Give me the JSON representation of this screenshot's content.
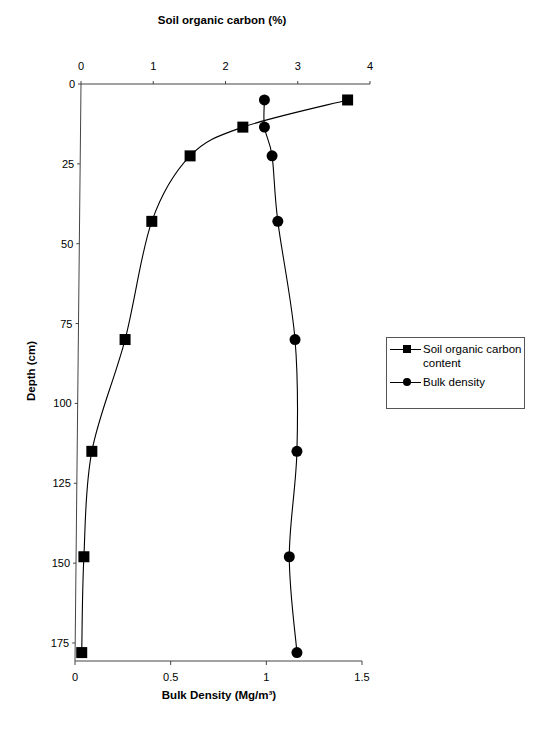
{
  "chart_data": {
    "type": "line",
    "title": "",
    "orientation": "depth-profile (y axis inverted, depth increases downward)",
    "top_axis": {
      "label": "Soil organic carbon (%)",
      "range": [
        0,
        4
      ],
      "ticks": [
        "0",
        "1",
        "2",
        "3",
        "4"
      ]
    },
    "bottom_axis": {
      "label": "Bulk Density (Mg/m³)",
      "range": [
        0,
        1.5
      ],
      "ticks": [
        "0",
        "0.5",
        "1",
        "1.5"
      ]
    },
    "left_axis": {
      "label": "Depth (cm)",
      "range": [
        0,
        180
      ],
      "ticks": [
        "0",
        "25",
        "50",
        "75",
        "100",
        "125",
        "150",
        "175"
      ]
    },
    "grid": false,
    "legend_position": "right",
    "series": [
      {
        "name": "Soil organic carbon content",
        "axis": "top",
        "marker": "square",
        "depth": [
          5,
          13.5,
          22.5,
          43,
          80,
          115,
          148,
          178
        ],
        "values": [
          3.69,
          2.24,
          1.51,
          0.98,
          0.61,
          0.15,
          0.04,
          0.01
        ]
      },
      {
        "name": "Bulk density",
        "axis": "bottom",
        "marker": "circle",
        "depth": [
          5,
          13.5,
          22.5,
          43,
          80,
          115,
          148,
          178
        ],
        "values": [
          0.99,
          0.99,
          1.03,
          1.06,
          1.15,
          1.16,
          1.12,
          1.16
        ]
      }
    ]
  },
  "legend": {
    "items": [
      {
        "label_line1": "Soil organic carbon",
        "label_line2": "content",
        "marker": "square"
      },
      {
        "label_line1": "Bulk density",
        "label_line2": "",
        "marker": "circle"
      }
    ]
  },
  "colors": {
    "series": "#000000",
    "axis": "#444444"
  }
}
